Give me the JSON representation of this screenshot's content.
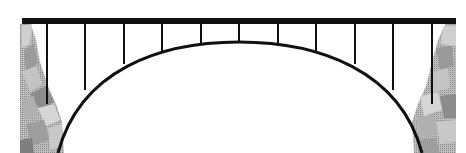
{
  "diagram": {
    "colors": {
      "background": "#ffffff",
      "structure": "#111111",
      "rock_light": "#d4d4d4",
      "rock_mid": "#a8a8a8",
      "rock_dark": "#7a7a7a"
    },
    "deck": {
      "x1": 22,
      "x2": 456,
      "y": 18,
      "thickness": 6
    },
    "arch": {
      "left_base": [
        58,
        153
      ],
      "apex": [
        239,
        42
      ],
      "right_base": [
        422,
        153
      ],
      "stroke": 3
    },
    "hangers": [
      {
        "x": 47,
        "bottom": 104
      },
      {
        "x": 85,
        "bottom": 90
      },
      {
        "x": 124,
        "bottom": 64
      },
      {
        "x": 162,
        "bottom": 52
      },
      {
        "x": 201,
        "bottom": 45
      },
      {
        "x": 239,
        "bottom": 42
      },
      {
        "x": 278,
        "bottom": 45
      },
      {
        "x": 316,
        "bottom": 52
      },
      {
        "x": 355,
        "bottom": 64
      },
      {
        "x": 393,
        "bottom": 90
      },
      {
        "x": 432,
        "bottom": 104
      }
    ],
    "abutments": [
      "left-rock-abutment",
      "right-rock-abutment"
    ]
  }
}
